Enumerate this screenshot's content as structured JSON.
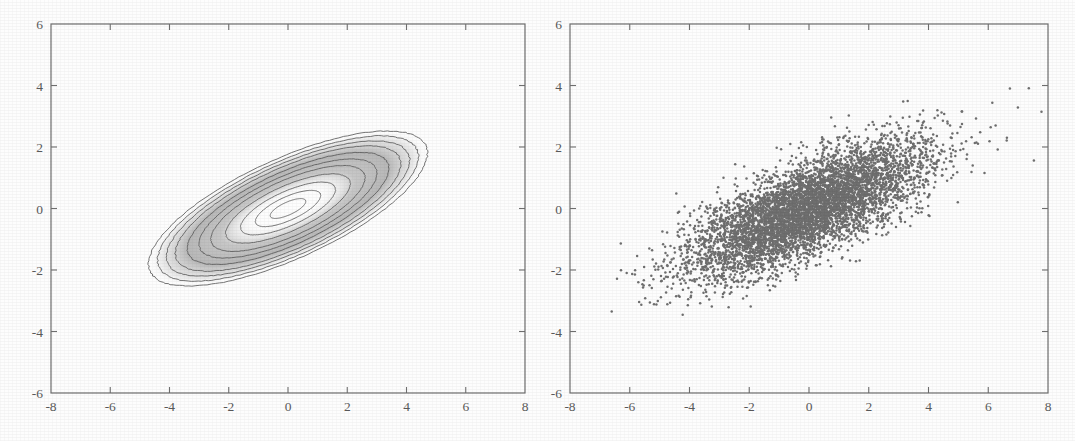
{
  "figure": {
    "background_color": "#fdfdfd",
    "ink_color": "#5c5c5c",
    "marker_color": "#6f6f6f",
    "panel_count": 2
  },
  "chart_data": [
    {
      "type": "line",
      "subtype": "contour",
      "panel": "left",
      "title": "",
      "xlabel": "",
      "ylabel": "",
      "xlim": [
        -8,
        8
      ],
      "ylim": [
        -6,
        6
      ],
      "xticks": [
        -8,
        -6,
        -4,
        -2,
        0,
        2,
        4,
        6,
        8
      ],
      "yticks": [
        -6,
        -4,
        -2,
        0,
        2,
        4,
        6
      ],
      "xticklabels": [
        "-8",
        "-6",
        "-4",
        "-2",
        "0",
        "2",
        "4",
        "6",
        "8"
      ],
      "yticklabels": [
        "-6",
        "-4",
        "-2",
        "0",
        "2",
        "4",
        "6"
      ],
      "grid": false,
      "legend": false,
      "description": "Contour plot of a bivariate Gaussian probability density with positive correlation; nested elliptical level curves tilted about 30 degrees from the x-axis, with a light (high density) core shading to white at the centre.",
      "distribution": {
        "mean": [
          0,
          0
        ],
        "covariance": [
          [
            4.0,
            1.6
          ],
          [
            1.6,
            1.2
          ]
        ],
        "correlation": 0.73,
        "sigma_x": 2.0,
        "sigma_y": 1.1,
        "ellipse_rotation_deg": 30
      },
      "contour_levels_sigma": [
        0.3,
        0.55,
        0.8,
        1.05,
        1.3,
        1.5,
        1.7,
        1.9,
        2.05,
        2.2,
        2.35
      ],
      "outer_contour_extent": {
        "x": [
          -4.3,
          4.3
        ],
        "y": [
          -2.5,
          2.5
        ]
      },
      "series": [
        {
          "name": "density contours",
          "n_levels": 11
        }
      ]
    },
    {
      "type": "scatter",
      "panel": "right",
      "title": "",
      "xlabel": "",
      "ylabel": "",
      "xlim": [
        -8,
        8
      ],
      "ylim": [
        -6,
        6
      ],
      "xticks": [
        -8,
        -6,
        -4,
        -2,
        0,
        2,
        4,
        6,
        8
      ],
      "yticks": [
        -6,
        -4,
        -2,
        0,
        2,
        4,
        6
      ],
      "xticklabels": [
        "-8",
        "-6",
        "-4",
        "-2",
        "0",
        "2",
        "4",
        "6",
        "8"
      ],
      "yticklabels": [
        "-6",
        "-4",
        "-2",
        "0",
        "2",
        "4",
        "6"
      ],
      "grid": false,
      "legend": false,
      "marker": "dot",
      "marker_size_px": 2,
      "marker_color": "#6f6f6f",
      "n_points": 6000,
      "description": "Scatter of samples drawn from the same correlated bivariate Gaussian shown at left; dense elongated cloud oriented up-and-to-the-right, spanning roughly x in [-7.5, 8] and y in [-3.9, 3.7].",
      "distribution": {
        "mean": [
          0,
          0
        ],
        "covariance": [
          [
            4.0,
            1.6
          ],
          [
            1.6,
            1.2
          ]
        ],
        "correlation": 0.73,
        "sigma_x": 2.0,
        "sigma_y": 1.1
      },
      "observed_range": {
        "x": [
          -7.5,
          8.0
        ],
        "y": [
          -3.9,
          3.7
        ]
      },
      "series": [
        {
          "name": "samples",
          "n": 6000
        }
      ]
    }
  ]
}
